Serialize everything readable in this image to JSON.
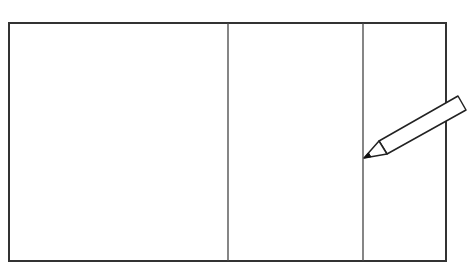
{
  "diagram": {
    "colors": {
      "background": "#ffffff",
      "stroke": "#333333",
      "divider": "#444444",
      "pencil_stroke": "#222222",
      "pencil_fill": "#ffffff",
      "pencil_lead": "#111111"
    },
    "outer_rect": {
      "x": 9,
      "y": 23,
      "width": 437,
      "height": 238,
      "stroke_width": 2
    },
    "dividers": [
      {
        "x": 228,
        "y1": 23,
        "y2": 261
      },
      {
        "x": 363,
        "y1": 23,
        "y2": 261
      }
    ],
    "sections": [
      {
        "index": 1,
        "x_start": 9,
        "x_end": 228
      },
      {
        "index": 2,
        "x_start": 228,
        "x_end": 363
      },
      {
        "index": 3,
        "x_start": 363,
        "x_end": 446
      }
    ],
    "pencil": {
      "tip": [
        364,
        158
      ],
      "collar_top": [
        379,
        141
      ],
      "collar_bottom": [
        387,
        154
      ],
      "end_top": [
        458,
        96
      ],
      "end_bottom": [
        466,
        110
      ]
    }
  }
}
